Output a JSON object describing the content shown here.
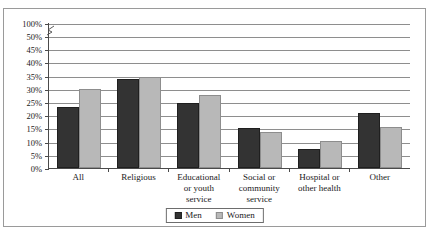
{
  "figure": {
    "title_remnant": "",
    "frame_visible": true
  },
  "chart_data": {
    "type": "bar",
    "title": "",
    "xlabel": "",
    "ylabel": "",
    "categories": [
      "All",
      "Educational or youth service",
      "Religious",
      "Social or community service",
      "Hospital or other health",
      "Other"
    ],
    "category_lines": [
      [
        "All"
      ],
      [
        "Religious"
      ],
      [
        "Educational",
        "or youth",
        "service"
      ],
      [
        "Social or",
        "community",
        "service"
      ],
      [
        "Hospital or",
        "other health"
      ],
      [
        "Other"
      ]
    ],
    "category_order": [
      "All",
      "Religious",
      "Educational or youth service",
      "Social or community service",
      "Hospital or other health",
      "Other"
    ],
    "series": [
      {
        "name": "Men",
        "color": "#333333",
        "values": [
          23.3,
          33.8,
          24.6,
          15.3,
          7.1,
          20.7
        ]
      },
      {
        "name": "Women",
        "color": "#b8b8b8",
        "values": [
          30.0,
          34.4,
          27.6,
          13.6,
          10.3,
          15.7
        ]
      }
    ],
    "ylim": [
      0,
      50
    ],
    "ytick_values": [
      0,
      5,
      10,
      15,
      20,
      25,
      30,
      35,
      40,
      45,
      50,
      100
    ],
    "ytick_labels": [
      "0%",
      "5%",
      "10%",
      "15%",
      "20%",
      "25%",
      "30%",
      "35%",
      "40%",
      "45%",
      "50%",
      "100%"
    ],
    "axis_break": {
      "present": true,
      "between": [
        50,
        100
      ],
      "symbol": "break-squiggle"
    },
    "grid": true,
    "grid_orientation": "horizontal",
    "legend_position": "bottom-center",
    "legend_entries": [
      "Men",
      "Women"
    ]
  },
  "legend": {
    "men_label": "Men",
    "women_label": "Women"
  }
}
